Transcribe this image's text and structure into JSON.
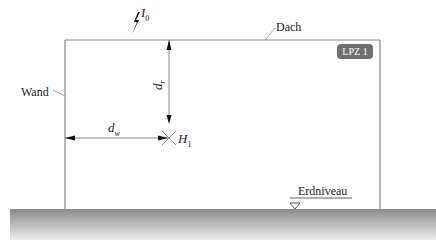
{
  "diagram": {
    "labels": {
      "lightning_current": "I",
      "lightning_current_sub": "0",
      "roof": "Dach",
      "wall": "Wand",
      "zone": "LPZ 1",
      "distance_roof": "d",
      "distance_roof_sub": "r",
      "distance_wall": "d",
      "distance_wall_sub": "w",
      "field_point": "H",
      "field_point_sub": "1",
      "ground_level": "Erdniveau"
    },
    "colors": {
      "line": "#888888",
      "arrow": "#111111",
      "badge": "#6f6f6f",
      "ground_top": "#8a8a8a",
      "ground_bottom": "#e6e6e6"
    }
  }
}
